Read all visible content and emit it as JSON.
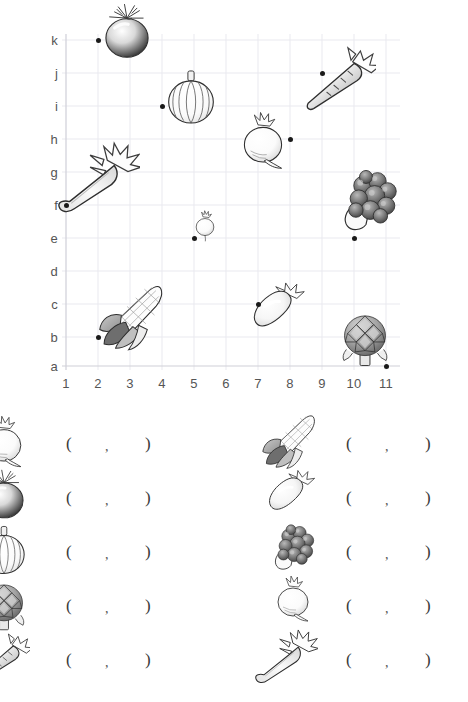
{
  "worksheet": {
    "type": "coordinate-grid-vegetables",
    "grid": {
      "x_labels": [
        "1",
        "2",
        "3",
        "4",
        "5",
        "6",
        "7",
        "8",
        "9",
        "10",
        "11"
      ],
      "y_labels": [
        "a",
        "b",
        "c",
        "d",
        "e",
        "f",
        "g",
        "h",
        "i",
        "j",
        "k"
      ],
      "y_labels_top_down": [
        "k",
        "j",
        "i",
        "h",
        "g",
        "f",
        "e",
        "d",
        "c",
        "b",
        "a"
      ],
      "grid_color": "#e9e9ef",
      "axis_color": "#cfcfd8",
      "dot_color": "#1a1a1a"
    },
    "plotted_items": [
      {
        "name": "tomato",
        "x": "2",
        "y": "k"
      },
      {
        "name": "carrot",
        "x": "9",
        "y": "j"
      },
      {
        "name": "pumpkin",
        "x": "4",
        "y": "i"
      },
      {
        "name": "turnip",
        "x": "8",
        "y": "h"
      },
      {
        "name": "celery",
        "x": "1",
        "y": "f"
      },
      {
        "name": "radish",
        "x": "5",
        "y": "e"
      },
      {
        "name": "broccoli",
        "x": "10",
        "y": "e"
      },
      {
        "name": "eggplant",
        "x": "7",
        "y": "c"
      },
      {
        "name": "corn",
        "x": "2",
        "y": "b"
      },
      {
        "name": "artichoke",
        "x": "11",
        "y": "a"
      }
    ]
  },
  "answers": {
    "open_paren": "(",
    "comma": ",",
    "close_paren": ")",
    "left_column": [
      {
        "icon": "radish-icon",
        "value_x": "",
        "value_y": ""
      },
      {
        "icon": "tomato-icon",
        "value_x": "",
        "value_y": ""
      },
      {
        "icon": "pumpkin-icon",
        "value_x": "",
        "value_y": ""
      },
      {
        "icon": "artichoke-icon",
        "value_x": "",
        "value_y": ""
      },
      {
        "icon": "carrot-icon",
        "value_x": "",
        "value_y": ""
      }
    ],
    "right_column": [
      {
        "icon": "corn-icon",
        "value_x": "",
        "value_y": ""
      },
      {
        "icon": "eggplant-icon",
        "value_x": "",
        "value_y": ""
      },
      {
        "icon": "broccoli-icon",
        "value_x": "",
        "value_y": ""
      },
      {
        "icon": "turnip-icon",
        "value_x": "",
        "value_y": ""
      },
      {
        "icon": "celery-icon",
        "value_x": "",
        "value_y": ""
      }
    ]
  }
}
